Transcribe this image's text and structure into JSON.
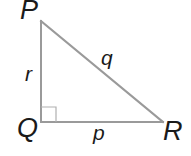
{
  "diagram": {
    "type": "right-triangle",
    "colors": {
      "line": "#9a9a9a",
      "text": "#1a1a1a",
      "background": "#ffffff"
    },
    "vertices": {
      "P": {
        "label": "P",
        "x": 41,
        "y": 21
      },
      "Q": {
        "label": "Q",
        "x": 41,
        "y": 122
      },
      "R": {
        "label": "R",
        "x": 163,
        "y": 122
      }
    },
    "sides": {
      "r": {
        "label": "r",
        "between": [
          "P",
          "Q"
        ]
      },
      "q": {
        "label": "q",
        "between": [
          "P",
          "R"
        ]
      },
      "p": {
        "label": "p",
        "between": [
          "Q",
          "R"
        ]
      }
    },
    "right_angle_at": "Q"
  }
}
